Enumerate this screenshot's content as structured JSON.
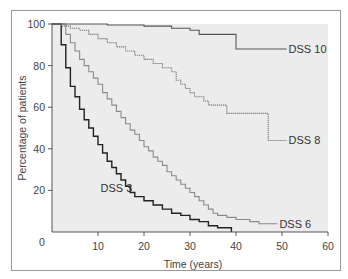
{
  "chart_data": {
    "type": "line",
    "subtype": "kaplan-meier step curves",
    "title": "",
    "xlabel": "Time (years)",
    "ylabel": "Percentage of patients",
    "xlim": [
      0,
      60
    ],
    "ylim": [
      0,
      100
    ],
    "xticks": [
      10,
      20,
      30,
      40,
      50,
      60
    ],
    "yticks": [
      0,
      20,
      40,
      60,
      80,
      100
    ],
    "x_origin_label": "0",
    "grid": false,
    "background": "#ececec",
    "series": [
      {
        "name": "DSS 3",
        "label": "DSS 3",
        "color": "#222222",
        "style": "solid",
        "points": [
          [
            0,
            100
          ],
          [
            2,
            100
          ],
          [
            2,
            90
          ],
          [
            3,
            90
          ],
          [
            3,
            79
          ],
          [
            4,
            79
          ],
          [
            4,
            70
          ],
          [
            5,
            70
          ],
          [
            5,
            65
          ],
          [
            6,
            65
          ],
          [
            6,
            59
          ],
          [
            7,
            59
          ],
          [
            7,
            54
          ],
          [
            8,
            54
          ],
          [
            8,
            50
          ],
          [
            9,
            50
          ],
          [
            9,
            46
          ],
          [
            10,
            46
          ],
          [
            10,
            42
          ],
          [
            11,
            42
          ],
          [
            11,
            38
          ],
          [
            12,
            38
          ],
          [
            12,
            34
          ],
          [
            13,
            34
          ],
          [
            13,
            31
          ],
          [
            14,
            31
          ],
          [
            14,
            28
          ],
          [
            15,
            28
          ],
          [
            15,
            25
          ],
          [
            16,
            25
          ],
          [
            16,
            22
          ],
          [
            17,
            22
          ],
          [
            17,
            19
          ],
          [
            18,
            19
          ],
          [
            18,
            17
          ],
          [
            20,
            17
          ],
          [
            20,
            15
          ],
          [
            22,
            15
          ],
          [
            22,
            13
          ],
          [
            24,
            13
          ],
          [
            24,
            11
          ],
          [
            26,
            11
          ],
          [
            26,
            9
          ],
          [
            28,
            9
          ],
          [
            28,
            8
          ],
          [
            30,
            8
          ],
          [
            30,
            6
          ],
          [
            32,
            6
          ],
          [
            32,
            5
          ],
          [
            34,
            5
          ],
          [
            34,
            3
          ],
          [
            36,
            3
          ],
          [
            36,
            2
          ],
          [
            39,
            2
          ],
          [
            39,
            0
          ]
        ],
        "label_at": [
          14,
          20
        ]
      },
      {
        "name": "DSS 6",
        "label": "DSS 6",
        "color": "#8a8a8a",
        "style": "solid",
        "points": [
          [
            0,
            100
          ],
          [
            3,
            100
          ],
          [
            3,
            95
          ],
          [
            4,
            95
          ],
          [
            4,
            91
          ],
          [
            5,
            91
          ],
          [
            5,
            87
          ],
          [
            6,
            87
          ],
          [
            6,
            83
          ],
          [
            7,
            83
          ],
          [
            7,
            80
          ],
          [
            8,
            80
          ],
          [
            8,
            77
          ],
          [
            9,
            77
          ],
          [
            9,
            74
          ],
          [
            10,
            74
          ],
          [
            10,
            71
          ],
          [
            11,
            71
          ],
          [
            11,
            67
          ],
          [
            12,
            67
          ],
          [
            12,
            64
          ],
          [
            13,
            64
          ],
          [
            13,
            61
          ],
          [
            14,
            61
          ],
          [
            14,
            58
          ],
          [
            15,
            58
          ],
          [
            15,
            55
          ],
          [
            16,
            55
          ],
          [
            16,
            52
          ],
          [
            17,
            52
          ],
          [
            17,
            49
          ],
          [
            18,
            49
          ],
          [
            18,
            47
          ],
          [
            19,
            47
          ],
          [
            19,
            44
          ],
          [
            20,
            44
          ],
          [
            20,
            41
          ],
          [
            21,
            41
          ],
          [
            21,
            39
          ],
          [
            22,
            39
          ],
          [
            22,
            36
          ],
          [
            23,
            36
          ],
          [
            23,
            34
          ],
          [
            24,
            34
          ],
          [
            24,
            32
          ],
          [
            25,
            32
          ],
          [
            25,
            29
          ],
          [
            26,
            29
          ],
          [
            26,
            27
          ],
          [
            27,
            27
          ],
          [
            27,
            25
          ],
          [
            28,
            25
          ],
          [
            28,
            23
          ],
          [
            29,
            23
          ],
          [
            29,
            21
          ],
          [
            30,
            21
          ],
          [
            30,
            19
          ],
          [
            31,
            19
          ],
          [
            31,
            17
          ],
          [
            32,
            17
          ],
          [
            32,
            15
          ],
          [
            33,
            15
          ],
          [
            33,
            13
          ],
          [
            34,
            13
          ],
          [
            34,
            11
          ],
          [
            35,
            11
          ],
          [
            35,
            9
          ],
          [
            36,
            9
          ],
          [
            36,
            8
          ],
          [
            38,
            8
          ],
          [
            38,
            7
          ],
          [
            40,
            7
          ],
          [
            40,
            6
          ],
          [
            43,
            6
          ],
          [
            43,
            5
          ],
          [
            45,
            5
          ],
          [
            45,
            4
          ],
          [
            49,
            4
          ]
        ],
        "label_at": [
          49,
          4
        ]
      },
      {
        "name": "DSS 8",
        "label": "DSS 8",
        "color": "#777777",
        "style": "dotted",
        "points": [
          [
            0,
            100
          ],
          [
            2,
            100
          ],
          [
            2,
            99
          ],
          [
            4,
            99
          ],
          [
            4,
            98
          ],
          [
            6,
            98
          ],
          [
            6,
            97
          ],
          [
            8,
            97
          ],
          [
            8,
            95
          ],
          [
            10,
            95
          ],
          [
            10,
            93
          ],
          [
            12,
            93
          ],
          [
            12,
            91
          ],
          [
            14,
            91
          ],
          [
            14,
            89
          ],
          [
            16,
            89
          ],
          [
            16,
            87
          ],
          [
            18,
            87
          ],
          [
            18,
            85
          ],
          [
            20,
            85
          ],
          [
            20,
            83
          ],
          [
            22,
            83
          ],
          [
            22,
            81
          ],
          [
            24,
            81
          ],
          [
            24,
            79
          ],
          [
            26,
            79
          ],
          [
            26,
            77
          ],
          [
            27,
            77
          ],
          [
            27,
            73
          ],
          [
            28,
            73
          ],
          [
            28,
            71
          ],
          [
            29,
            71
          ],
          [
            29,
            69
          ],
          [
            30,
            69
          ],
          [
            30,
            67
          ],
          [
            31,
            67
          ],
          [
            31,
            65
          ],
          [
            33,
            65
          ],
          [
            33,
            63
          ],
          [
            34,
            63
          ],
          [
            34,
            61
          ],
          [
            38,
            61
          ],
          [
            38,
            57
          ],
          [
            47,
            57
          ],
          [
            47,
            44
          ],
          [
            51,
            44
          ]
        ],
        "label_at": [
          51,
          44
        ]
      },
      {
        "name": "DSS 10",
        "label": "DSS 10",
        "color": "#555555",
        "style": "solid",
        "points": [
          [
            0,
            100
          ],
          [
            12,
            100
          ],
          [
            12,
            99.5
          ],
          [
            20,
            99.5
          ],
          [
            20,
            99
          ],
          [
            26,
            99
          ],
          [
            26,
            98
          ],
          [
            30,
            98
          ],
          [
            30,
            97
          ],
          [
            32,
            97
          ],
          [
            32,
            95
          ],
          [
            40,
            95
          ],
          [
            40,
            88
          ],
          [
            51,
            88
          ]
        ],
        "label_at": [
          51,
          88
        ]
      }
    ]
  }
}
